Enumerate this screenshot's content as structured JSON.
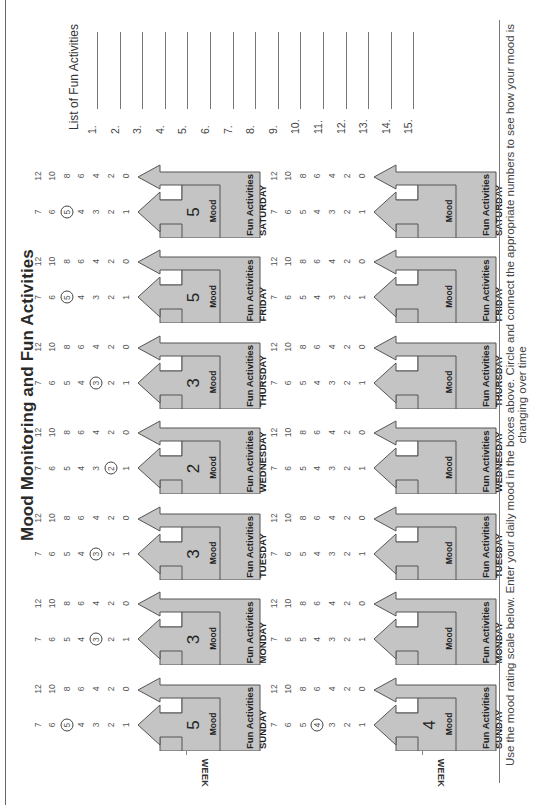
{
  "title": "Mood Monitoring and Fun Activities",
  "footer_text": "Use the mood rating scale below. Enter your daily mood in the boxes above. Circle and connect the appropriate numbers to see how your mood is changing over time",
  "labels": {
    "mood": "Mood",
    "fun_activities": "Fun Activities",
    "week": "WEEK"
  },
  "scales": {
    "mood": [
      "7",
      "6",
      "5",
      "4",
      "3",
      "2",
      "1"
    ],
    "fun": [
      "12",
      "10",
      "8",
      "6",
      "4",
      "2",
      "0"
    ]
  },
  "colors": {
    "arrow_fill": "#c4c4c4",
    "arrow_stroke": "#555555"
  },
  "weeks": [
    {
      "week_label": "WEEK",
      "days": [
        {
          "day": "SUNDAY",
          "mood": "5",
          "circled_mood": "5",
          "circled_fun": ""
        },
        {
          "day": "MONDAY",
          "mood": "3",
          "circled_mood": "3",
          "circled_fun": ""
        },
        {
          "day": "TUESDAY",
          "mood": "3",
          "circled_mood": "3",
          "circled_fun": ""
        },
        {
          "day": "WEDNESDAY",
          "mood": "2",
          "circled_mood": "2",
          "circled_fun": ""
        },
        {
          "day": "THURSDAY",
          "mood": "3",
          "circled_mood": "3",
          "circled_fun": ""
        },
        {
          "day": "FRIDAY",
          "mood": "5",
          "circled_mood": "5",
          "circled_fun": ""
        },
        {
          "day": "SATURDAY",
          "mood": "5",
          "circled_mood": "5",
          "circled_fun": ""
        }
      ]
    },
    {
      "week_label": "WEEK",
      "days": [
        {
          "day": "SUNDAY",
          "mood": "4",
          "circled_mood": "4",
          "circled_fun": ""
        },
        {
          "day": "MONDAY",
          "mood": "",
          "circled_mood": "",
          "circled_fun": ""
        },
        {
          "day": "TUESDAY",
          "mood": "",
          "circled_mood": "",
          "circled_fun": ""
        },
        {
          "day": "WEDNESDAY",
          "mood": "",
          "circled_mood": "",
          "circled_fun": ""
        },
        {
          "day": "THURSDAY",
          "mood": "",
          "circled_mood": "",
          "circled_fun": ""
        },
        {
          "day": "FRIDAY",
          "mood": "",
          "circled_mood": "",
          "circled_fun": ""
        },
        {
          "day": "SATURDAY",
          "mood": "",
          "circled_mood": "",
          "circled_fun": ""
        }
      ]
    }
  ],
  "fun_list": {
    "title": "List of Fun Activities",
    "items": [
      {
        "number": "1.",
        "value": ""
      },
      {
        "number": "2.",
        "value": ""
      },
      {
        "number": "3.",
        "value": ""
      },
      {
        "number": "4.",
        "value": ""
      },
      {
        "number": "5.",
        "value": ""
      },
      {
        "number": "6.",
        "value": ""
      },
      {
        "number": "7.",
        "value": ""
      },
      {
        "number": "8.",
        "value": ""
      },
      {
        "number": "9.",
        "value": ""
      },
      {
        "number": "10.",
        "value": ""
      },
      {
        "number": "11.",
        "value": ""
      },
      {
        "number": "12.",
        "value": ""
      },
      {
        "number": "13.",
        "value": ""
      },
      {
        "number": "14.",
        "value": ""
      },
      {
        "number": "15.",
        "value": ""
      }
    ]
  }
}
